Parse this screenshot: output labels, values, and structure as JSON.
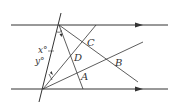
{
  "diagram": {
    "type": "geometry",
    "colors": {
      "line": "#333333",
      "background": "#ffffff"
    },
    "labels": {
      "x_angle": "x°",
      "y_angle": "y°",
      "A": "A",
      "B": "B",
      "C": "C",
      "D": "D"
    }
  }
}
